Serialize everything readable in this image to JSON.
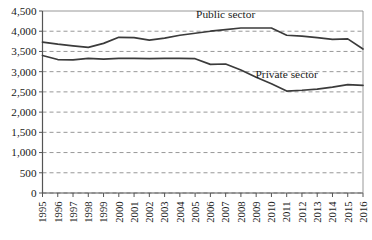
{
  "chart_data": {
    "type": "line",
    "title": "",
    "subtitle": "",
    "xlabel": "",
    "ylabel": "",
    "grid": true,
    "legend_position": "inline-annotation",
    "x": [
      1995,
      1996,
      1997,
      1998,
      1999,
      2000,
      2001,
      2002,
      2003,
      2004,
      2005,
      2006,
      2007,
      2008,
      2009,
      2010,
      2011,
      2012,
      2013,
      2014,
      2015,
      2016
    ],
    "categories": [
      "1995",
      "1996",
      "1997",
      "1998",
      "1999",
      "2000",
      "2001",
      "2002",
      "2003",
      "2004",
      "2005",
      "2006",
      "2007",
      "2008",
      "2009",
      "2010",
      "2011",
      "2012",
      "2013",
      "2014",
      "2015",
      "2016"
    ],
    "xlim": [
      1995,
      2016
    ],
    "ylim": [
      0,
      4500
    ],
    "yticks": [
      0,
      500,
      1000,
      1500,
      2000,
      2500,
      3000,
      3500,
      4000,
      4500
    ],
    "ytick_labels": [
      "0",
      "500",
      "1,000",
      "1,500",
      "2,000",
      "2,500",
      "3,000",
      "3,500",
      "4,000",
      "4,500"
    ],
    "series": [
      {
        "name": "Public sector",
        "label": "Public sector",
        "color": "#3b3b3b",
        "label_x": 2007,
        "label_y": 4330,
        "values": [
          3730,
          3680,
          3640,
          3600,
          3700,
          3850,
          3840,
          3780,
          3830,
          3900,
          3950,
          4000,
          4040,
          4080,
          4080,
          4080,
          3900,
          3880,
          3840,
          3800,
          3810,
          3560
        ]
      },
      {
        "name": "Private sector",
        "label": "Private sector",
        "color": "#3b3b3b",
        "label_x": 2011,
        "label_y": 2840,
        "values": [
          3400,
          3300,
          3290,
          3330,
          3310,
          3330,
          3330,
          3320,
          3330,
          3330,
          3320,
          3180,
          3190,
          3040,
          2860,
          2700,
          2520,
          2540,
          2570,
          2620,
          2680,
          2660
        ]
      }
    ]
  },
  "labels": {
    "public_sector": "Public sector",
    "private_sector": "Private sector"
  }
}
